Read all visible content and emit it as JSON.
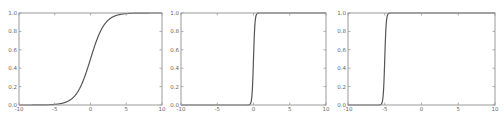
{
  "chart_data": [
    {
      "type": "line",
      "title": "",
      "xlabel": "",
      "ylabel": "",
      "xlim": [
        -10,
        10
      ],
      "ylim": [
        0.0,
        1.0
      ],
      "xticks": [
        "-10",
        "-5",
        "0",
        "5",
        "10"
      ],
      "yticks": [
        "0.0",
        "0.2",
        "0.4",
        "0.6",
        "0.8",
        "1.0"
      ],
      "grid": false,
      "series": [
        {
          "name": "sigmoid(x)",
          "function": "1/(1+exp(-x))",
          "midpoint": 0,
          "steepness": 1,
          "x": [
            -10,
            -8,
            -6,
            -5,
            -4,
            -3,
            -2,
            -1,
            0,
            1,
            2,
            3,
            4,
            5,
            6,
            8,
            10
          ],
          "y": [
            5e-05,
            0.0003,
            0.0025,
            0.0067,
            0.018,
            0.047,
            0.119,
            0.269,
            0.5,
            0.731,
            0.881,
            0.953,
            0.982,
            0.993,
            0.9975,
            0.9997,
            0.99995
          ]
        }
      ]
    },
    {
      "type": "line",
      "title": "",
      "xlabel": "",
      "ylabel": "",
      "xlim": [
        -10,
        10
      ],
      "ylim": [
        0.0,
        1.0
      ],
      "xticks": [
        "-10",
        "-5",
        "0",
        "5",
        "10"
      ],
      "yticks": [
        "0.0",
        "0.2",
        "0.4",
        "0.6",
        "0.8",
        "1.0"
      ],
      "grid": false,
      "series": [
        {
          "name": "sigmoid(10x)",
          "function": "1/(1+exp(-10x))",
          "midpoint": 0,
          "steepness": 10,
          "x": [
            -10,
            -1,
            -0.5,
            -0.3,
            -0.2,
            -0.1,
            0,
            0.1,
            0.2,
            0.3,
            0.5,
            1,
            10
          ],
          "y": [
            0.0,
            5e-05,
            0.0067,
            0.047,
            0.119,
            0.269,
            0.5,
            0.731,
            0.881,
            0.953,
            0.993,
            0.99995,
            1.0
          ]
        }
      ]
    },
    {
      "type": "line",
      "title": "",
      "xlabel": "",
      "ylabel": "",
      "xlim": [
        -10,
        10
      ],
      "ylim": [
        0.0,
        1.0
      ],
      "xticks": [
        "-10",
        "-5",
        "0",
        "5",
        "10"
      ],
      "yticks": [
        "0.0",
        "0.2",
        "0.4",
        "0.6",
        "0.8",
        "1.0"
      ],
      "grid": false,
      "series": [
        {
          "name": "sigmoid(10x+50)",
          "function": "1/(1+exp(-(10x+50)))",
          "midpoint": -5,
          "steepness": 10,
          "x": [
            -10,
            -6,
            -5.5,
            -5.3,
            -5.2,
            -5.1,
            -5,
            -4.9,
            -4.8,
            -4.7,
            -4.5,
            -4,
            10
          ],
          "y": [
            0.0,
            5e-05,
            0.0067,
            0.047,
            0.119,
            0.269,
            0.5,
            0.731,
            0.881,
            0.953,
            0.993,
            0.99995,
            1.0
          ]
        }
      ]
    }
  ],
  "panels": [
    {
      "left": 19,
      "right": 162,
      "top": 13,
      "bottom": 105
    },
    {
      "left": 181,
      "right": 326,
      "top": 13,
      "bottom": 105
    },
    {
      "left": 348,
      "right": 495,
      "top": 13,
      "bottom": 105
    }
  ],
  "colors": {
    "curve": "#555555",
    "axes": "#9a9a9a",
    "tick_label": "#666666"
  }
}
